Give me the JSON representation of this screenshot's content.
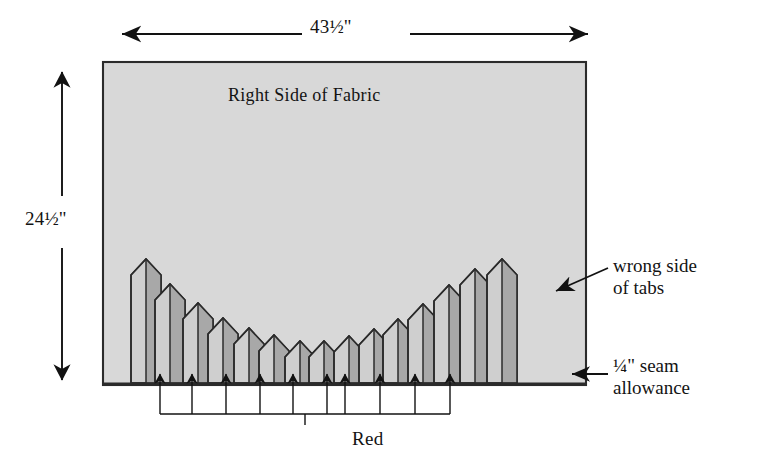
{
  "figure": {
    "title_text": "Right Side of Fabric",
    "type": "sewing-diagram",
    "background_color": "#ffffff",
    "line_color": "#1a1a1a"
  },
  "dimensions": {
    "width_label": "43½\"",
    "height_label": "24½\"",
    "width_value": 43.5,
    "height_value": 24.5,
    "units": "inches"
  },
  "fabric": {
    "label": "Right Side of Fabric",
    "fill_color": "#d6d6d6",
    "border_color": "#2b2b2b",
    "rect": {
      "x": 103,
      "y": 62,
      "width": 483,
      "height": 323
    }
  },
  "annotations": {
    "wrong_side": {
      "line1": "wrong side",
      "line2": "of tabs"
    },
    "seam": {
      "line1": "¼\" seam",
      "line2": "allowance"
    },
    "bracket_label": "Red"
  },
  "tabs": {
    "count": 15,
    "light_fill": "#cfcfcf",
    "dark_fill": "#a8a8a8",
    "outline_color": "#2b2b2b",
    "baseline_y": 383,
    "width": 30,
    "peak_rise": 16,
    "items": [
      {
        "index": 0,
        "x": 131,
        "top_y": 259
      },
      {
        "index": 1,
        "x": 155,
        "top_y": 284
      },
      {
        "index": 2,
        "x": 183,
        "top_y": 303
      },
      {
        "index": 3,
        "x": 208,
        "top_y": 318
      },
      {
        "index": 4,
        "x": 234,
        "top_y": 328
      },
      {
        "index": 5,
        "x": 259,
        "top_y": 335
      },
      {
        "index": 6,
        "x": 285,
        "top_y": 341
      },
      {
        "index": 7,
        "x": 309,
        "top_y": 341
      },
      {
        "index": 8,
        "x": 334,
        "top_y": 336
      },
      {
        "index": 9,
        "x": 359,
        "top_y": 329
      },
      {
        "index": 10,
        "x": 383,
        "top_y": 319
      },
      {
        "index": 11,
        "x": 408,
        "top_y": 304
      },
      {
        "index": 12,
        "x": 434,
        "top_y": 285
      },
      {
        "index": 13,
        "x": 460,
        "top_y": 269
      },
      {
        "index": 14,
        "x": 487,
        "top_y": 259
      }
    ]
  },
  "bracket": {
    "arrow_count": 10,
    "arrow_x_positions": [
      160,
      192,
      226,
      260,
      293,
      327,
      345,
      380,
      415,
      450
    ],
    "top_y": 401,
    "rail_y": 414,
    "stem_bottom_y": 425
  }
}
